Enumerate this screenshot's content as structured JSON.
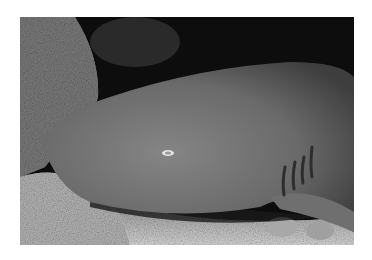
{
  "image": {
    "subject": "Nurse shark resting on sandy sea floor beside coral rock",
    "style": "grayscale photograph",
    "colors": {
      "background": "#ffffff",
      "water": "#0b0b0b",
      "shark_body": "#6e6e6e",
      "shark_highlight": "#8a8a8a",
      "sand": "#cfcfcf",
      "coral": "#9a9a9a"
    }
  }
}
